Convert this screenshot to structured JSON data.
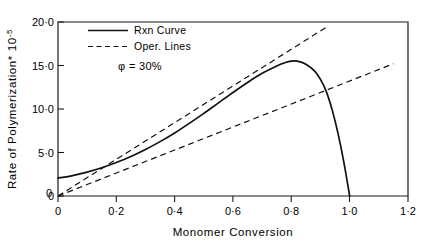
{
  "chart_data": {
    "type": "line",
    "title": "",
    "xlabel": "Monomer Conversion",
    "ylabel": "Rate of Polymerization",
    "ylabel_multiplier": "* 10",
    "ylabel_exponent": "-5",
    "xlim": [
      0,
      1.2
    ],
    "ylim": [
      0,
      20.0
    ],
    "grid": false,
    "legend_position": "top-center",
    "annotation": "φ = 30%",
    "xticks": [
      "0",
      "0·2",
      "0·4",
      "0·6",
      "0·8",
      "1·0",
      "1·2"
    ],
    "xtick_values": [
      0,
      0.2,
      0.4,
      0.6,
      0.8,
      1.0,
      1.2
    ],
    "yticks": [
      "0",
      "5·0",
      "10·0",
      "15·0",
      "20·0"
    ],
    "ytick_values": [
      0,
      5.0,
      10.0,
      15.0,
      20.0
    ],
    "origin_label": "0",
    "series": [
      {
        "name": "Rxn Curve",
        "style": "solid",
        "points": [
          [
            0.0,
            2.05
          ],
          [
            0.05,
            2.35
          ],
          [
            0.1,
            2.75
          ],
          [
            0.15,
            3.25
          ],
          [
            0.2,
            3.85
          ],
          [
            0.25,
            4.55
          ],
          [
            0.3,
            5.35
          ],
          [
            0.35,
            6.25
          ],
          [
            0.4,
            7.25
          ],
          [
            0.45,
            8.35
          ],
          [
            0.5,
            9.5
          ],
          [
            0.55,
            10.7
          ],
          [
            0.6,
            11.9
          ],
          [
            0.65,
            13.05
          ],
          [
            0.7,
            14.1
          ],
          [
            0.75,
            14.95
          ],
          [
            0.78,
            15.35
          ],
          [
            0.8,
            15.5
          ],
          [
            0.82,
            15.5
          ],
          [
            0.85,
            15.15
          ],
          [
            0.88,
            14.35
          ],
          [
            0.9,
            13.4
          ],
          [
            0.92,
            12.0
          ],
          [
            0.94,
            9.9
          ],
          [
            0.96,
            7.2
          ],
          [
            0.98,
            3.9
          ],
          [
            1.0,
            0.0
          ]
        ]
      },
      {
        "name": "Oper. Line 1",
        "style": "dashed",
        "points": [
          [
            0.0,
            0.0
          ],
          [
            0.92,
            19.4
          ]
        ]
      },
      {
        "name": "Oper. Line 2",
        "style": "dashed",
        "points": [
          [
            0.0,
            0.0
          ],
          [
            1.15,
            15.2
          ]
        ]
      }
    ],
    "legend": [
      {
        "label": "Rxn Curve",
        "style": "solid"
      },
      {
        "label": "Oper. Lines",
        "style": "dashed"
      }
    ]
  }
}
